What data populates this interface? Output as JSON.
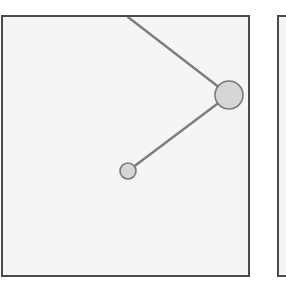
{
  "figure": {
    "background_color": "#ffffff",
    "panels": [
      {
        "name": "primary-panel",
        "label": "",
        "x": 1,
        "y": 15,
        "width": 249,
        "height": 262,
        "fill_color": "#f5f5f5",
        "border_color": "#4a4a4a",
        "border_width": 2
      },
      {
        "name": "secondary-panel",
        "label": "",
        "x": 277,
        "y": 15,
        "width": 40,
        "height": 262,
        "fill_color": "#f5f5f5",
        "border_color": "#4a4a4a",
        "border_width": 2,
        "clipped": true
      }
    ]
  },
  "chart_data": {
    "type": "scatter",
    "title": "",
    "subtitle": "",
    "xlabel": "",
    "ylabel": "",
    "xlim": [
      0,
      245
    ],
    "ylim": [
      0,
      258
    ],
    "grid": false,
    "legend": null,
    "node_fill_color": "#d6d6d6",
    "node_stroke_color": "#7a7a7a",
    "edge_color": "#7d7d7d",
    "edge_width": 2.4,
    "nodes": [
      {
        "id": "node-large",
        "label": "",
        "x": 226,
        "y": 78,
        "radius": 14
      },
      {
        "id": "node-small",
        "label": "",
        "x": 125,
        "y": 154,
        "radius": 8
      }
    ],
    "edges": [
      {
        "id": "edge-top-inbound",
        "label": "",
        "from": "boundary-top",
        "to": "node-large",
        "x1": 125,
        "y1": 0,
        "x2": 226,
        "y2": 78,
        "clipped_at_panel_edge": true
      },
      {
        "id": "edge-large-small",
        "label": "",
        "from": "node-large",
        "to": "node-small",
        "x1": 226,
        "y1": 78,
        "x2": 125,
        "y2": 154,
        "clipped_at_panel_edge": false
      }
    ]
  }
}
